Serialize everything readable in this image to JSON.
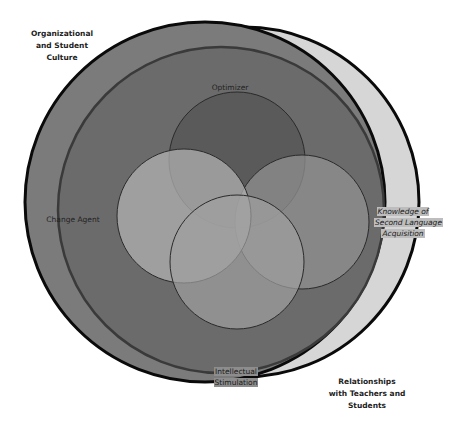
{
  "diagram": {
    "type": "nested-venn",
    "outer_labels": {
      "top_left": [
        "Organizational",
        "and Student",
        "Culture"
      ],
      "bottom_right": [
        "Relationships",
        "with Teachers and",
        "Students"
      ]
    },
    "crescent_label": [
      "Knowledge of",
      "Second Language",
      "Acquisition"
    ],
    "ring_labels": {
      "top": "Optimizer",
      "left": "Change Agent",
      "bottom": [
        "Intellectual",
        "Stimulation"
      ]
    },
    "colors": {
      "crescent_fill": "#d4d4d4",
      "outer_fill": "#7a7a7a",
      "inner_fill": "#6c6c6c",
      "circle_top": "#5e5e5e",
      "circle_left": "#a8a8a8",
      "circle_right": "#8f8f8f",
      "circle_bottom": "#9a9a9a",
      "stroke": "#111111"
    }
  }
}
